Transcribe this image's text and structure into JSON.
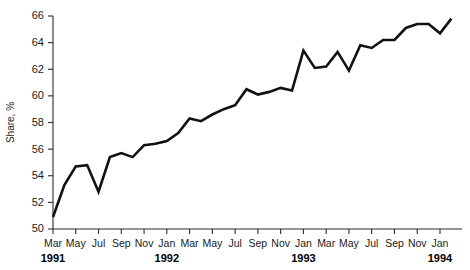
{
  "chart_data": {
    "type": "line",
    "title": "",
    "xlabel": "",
    "ylabel": "Share, %",
    "ylim": [
      50,
      66
    ],
    "ytick_values": [
      50,
      52,
      54,
      56,
      58,
      60,
      62,
      64,
      66
    ],
    "ytick_labels": [
      "50",
      "52",
      "54",
      "56",
      "58",
      "60",
      "62",
      "64",
      "66"
    ],
    "grid": false,
    "legend": "none",
    "x": [
      "Mar 1991",
      "Apr 1991",
      "May 1991",
      "Jun 1991",
      "Jul 1991",
      "Aug 1991",
      "Sep 1991",
      "Oct 1991",
      "Nov 1991",
      "Dec 1991",
      "Jan 1992",
      "Feb 1992",
      "Mar 1992",
      "Apr 1992",
      "May 1992",
      "Jun 1992",
      "Jul 1992",
      "Aug 1992",
      "Sep 1992",
      "Oct 1992",
      "Nov 1992",
      "Dec 1992",
      "Jan 1993",
      "Feb 1993",
      "Mar 1993",
      "Apr 1993",
      "May 1993",
      "Jun 1993",
      "Jul 1993",
      "Aug 1993",
      "Sep 1993",
      "Oct 1993",
      "Nov 1993",
      "Dec 1993",
      "Jan 1994",
      "Feb 1994"
    ],
    "values": [
      50.9,
      53.3,
      54.7,
      54.8,
      52.8,
      55.4,
      55.7,
      55.4,
      56.3,
      56.4,
      56.6,
      57.2,
      58.3,
      58.1,
      58.6,
      59.0,
      59.3,
      60.5,
      60.1,
      60.3,
      60.6,
      60.4,
      63.4,
      62.1,
      62.2,
      63.3,
      61.9,
      63.8,
      63.6,
      64.2,
      64.2,
      65.1,
      65.4,
      65.4,
      64.7,
      65.8
    ],
    "xticks": [
      {
        "month": "Mar",
        "index": 0
      },
      {
        "month": "May",
        "index": 2
      },
      {
        "month": "Jul",
        "index": 4
      },
      {
        "month": "Sep",
        "index": 6
      },
      {
        "month": "Nov",
        "index": 8
      },
      {
        "month": "Jan",
        "index": 10
      },
      {
        "month": "Mar",
        "index": 12
      },
      {
        "month": "May",
        "index": 14
      },
      {
        "month": "Jul",
        "index": 16
      },
      {
        "month": "Sep",
        "index": 18
      },
      {
        "month": "Nov",
        "index": 20
      },
      {
        "month": "Jan",
        "index": 22
      },
      {
        "month": "Mar",
        "index": 24
      },
      {
        "month": "May",
        "index": 26
      },
      {
        "month": "Jul",
        "index": 28
      },
      {
        "month": "Sep",
        "index": 30
      },
      {
        "month": "Nov",
        "index": 32
      },
      {
        "month": "Jan",
        "index": 34
      }
    ],
    "year_labels": [
      {
        "year": "1991",
        "index": 0
      },
      {
        "year": "1992",
        "index": 10
      },
      {
        "year": "1993",
        "index": 22
      },
      {
        "year": "1994",
        "index": 34
      }
    ],
    "series_color": "#111111",
    "axis_color": "#2b2b2b"
  }
}
